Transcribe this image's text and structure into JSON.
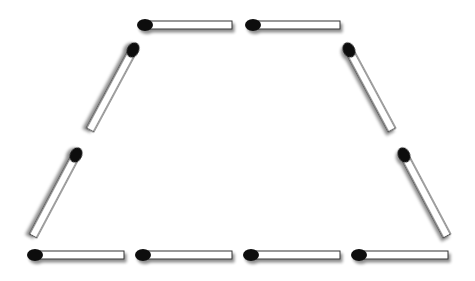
{
  "diagram": {
    "colors": {
      "background": "#ffffff",
      "stick_fill": "#ffffff",
      "stick_outline": "#333333",
      "head": "#111111",
      "shadow": "#9a9a9a"
    },
    "match_count": 9,
    "matches": [
      {
        "id": "top-1",
        "head": [
          145,
          25
        ],
        "tail": [
          232,
          25
        ]
      },
      {
        "id": "top-2",
        "head": [
          253,
          25
        ],
        "tail": [
          340,
          25
        ]
      },
      {
        "id": "upper-left",
        "head": [
          133,
          50
        ],
        "tail": [
          90,
          130
        ]
      },
      {
        "id": "upper-right",
        "head": [
          349,
          50
        ],
        "tail": [
          392,
          130
        ]
      },
      {
        "id": "lower-left",
        "head": [
          76,
          155
        ],
        "tail": [
          33,
          236
        ]
      },
      {
        "id": "lower-right",
        "head": [
          404,
          155
        ],
        "tail": [
          447,
          236
        ]
      },
      {
        "id": "bottom-1",
        "head": [
          35,
          255
        ],
        "tail": [
          124,
          255
        ]
      },
      {
        "id": "bottom-2",
        "head": [
          143,
          255
        ],
        "tail": [
          232,
          255
        ]
      },
      {
        "id": "bottom-3",
        "head": [
          251,
          255
        ],
        "tail": [
          340,
          255
        ]
      },
      {
        "id": "bottom-4",
        "head": [
          359,
          255
        ],
        "tail": [
          448,
          255
        ]
      }
    ]
  }
}
